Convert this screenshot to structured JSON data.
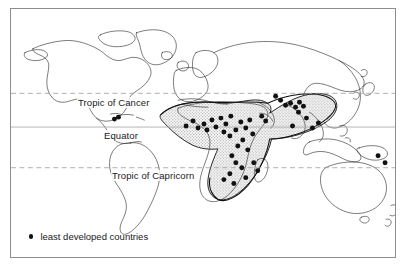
{
  "figure": {
    "frame_border_color": "#8d8d8d",
    "background_color": "#ffffff"
  },
  "map": {
    "projection": "world-mercator-outline",
    "coastline_color": "#222222",
    "shading_color": "#d3d3d3",
    "shading_description": "stippled grey region covering Sub-Saharan Africa, Arabia, South Asia and Southeast Asia",
    "dot_color": "#111111",
    "dot_label": "least developed country"
  },
  "latitude_lines": [
    {
      "name": "tropic-of-cancer",
      "label": "Tropic of Cancer",
      "style": "dashed",
      "color": "#9a9a9a",
      "y": 93
    },
    {
      "name": "equator",
      "label": "Equator",
      "style": "solid",
      "color": "#9a9a9a",
      "y": 126
    },
    {
      "name": "tropic-of-capricorn",
      "label": "Tropic of Capricorn",
      "style": "dashed",
      "color": "#9a9a9a",
      "y": 166
    }
  ],
  "legend": {
    "marker": "filled-circle",
    "text": "least developed countries"
  },
  "chart_data": {
    "type": "map",
    "title": "least developed countries",
    "legend_entries": [
      "least developed countries"
    ],
    "annotations": [
      "Tropic of Cancer",
      "Equator",
      "Tropic of Capricorn"
    ],
    "marker_count": 47,
    "markers": [
      {
        "region": "Caribbean",
        "x": 104,
        "y": 111
      },
      {
        "region": "Caribbean",
        "x": 108,
        "y": 109
      },
      {
        "region": "West Africa",
        "x": 176,
        "y": 118
      },
      {
        "region": "West Africa",
        "x": 183,
        "y": 113
      },
      {
        "region": "West Africa",
        "x": 188,
        "y": 120
      },
      {
        "region": "West Africa",
        "x": 194,
        "y": 116
      },
      {
        "region": "West Africa",
        "x": 197,
        "y": 122
      },
      {
        "region": "West Africa",
        "x": 202,
        "y": 112
      },
      {
        "region": "West Africa",
        "x": 206,
        "y": 119
      },
      {
        "region": "Sahel",
        "x": 211,
        "y": 110
      },
      {
        "region": "Sahel",
        "x": 216,
        "y": 116
      },
      {
        "region": "Sahel",
        "x": 221,
        "y": 108
      },
      {
        "region": "Central Africa",
        "x": 214,
        "y": 124
      },
      {
        "region": "Central Africa",
        "x": 220,
        "y": 128
      },
      {
        "region": "Central Africa",
        "x": 226,
        "y": 122
      },
      {
        "region": "East Africa",
        "x": 231,
        "y": 114
      },
      {
        "region": "East Africa",
        "x": 236,
        "y": 120
      },
      {
        "region": "East Africa",
        "x": 240,
        "y": 112
      },
      {
        "region": "East Africa",
        "x": 243,
        "y": 126
      },
      {
        "region": "East Africa",
        "x": 233,
        "y": 132
      },
      {
        "region": "East Africa",
        "x": 228,
        "y": 138
      },
      {
        "region": "East Africa",
        "x": 238,
        "y": 142
      },
      {
        "region": "Central Africa",
        "x": 222,
        "y": 148
      },
      {
        "region": "Southern Africa",
        "x": 226,
        "y": 155
      },
      {
        "region": "Southern Africa",
        "x": 232,
        "y": 160
      },
      {
        "region": "Southern Africa",
        "x": 220,
        "y": 166
      },
      {
        "region": "Southern Africa",
        "x": 236,
        "y": 170
      },
      {
        "region": "Indian Ocean",
        "x": 248,
        "y": 163
      },
      {
        "region": "Indian Ocean",
        "x": 244,
        "y": 155
      },
      {
        "region": "Southern Africa",
        "x": 224,
        "y": 176
      },
      {
        "region": "Southern Africa",
        "x": 214,
        "y": 172
      },
      {
        "region": "Arabia",
        "x": 252,
        "y": 108
      },
      {
        "region": "Arabia",
        "x": 256,
        "y": 113
      },
      {
        "region": "South Asia",
        "x": 276,
        "y": 97
      },
      {
        "region": "South Asia",
        "x": 281,
        "y": 95
      },
      {
        "region": "South Asia",
        "x": 286,
        "y": 99
      },
      {
        "region": "South Asia",
        "x": 290,
        "y": 94
      },
      {
        "region": "South Asia",
        "x": 294,
        "y": 98
      },
      {
        "region": "South Asia",
        "x": 289,
        "y": 104
      },
      {
        "region": "South Asia",
        "x": 283,
        "y": 118
      },
      {
        "region": "Southeast Asia",
        "x": 297,
        "y": 110
      },
      {
        "region": "Southeast Asia",
        "x": 303,
        "y": 120
      },
      {
        "region": "Southeast Asia",
        "x": 309,
        "y": 115
      },
      {
        "region": "Central Asia",
        "x": 266,
        "y": 88
      },
      {
        "region": "Himalaya",
        "x": 271,
        "y": 92
      },
      {
        "region": "Pacific",
        "x": 376,
        "y": 155
      },
      {
        "region": "Pacific",
        "x": 369,
        "y": 148
      }
    ]
  }
}
